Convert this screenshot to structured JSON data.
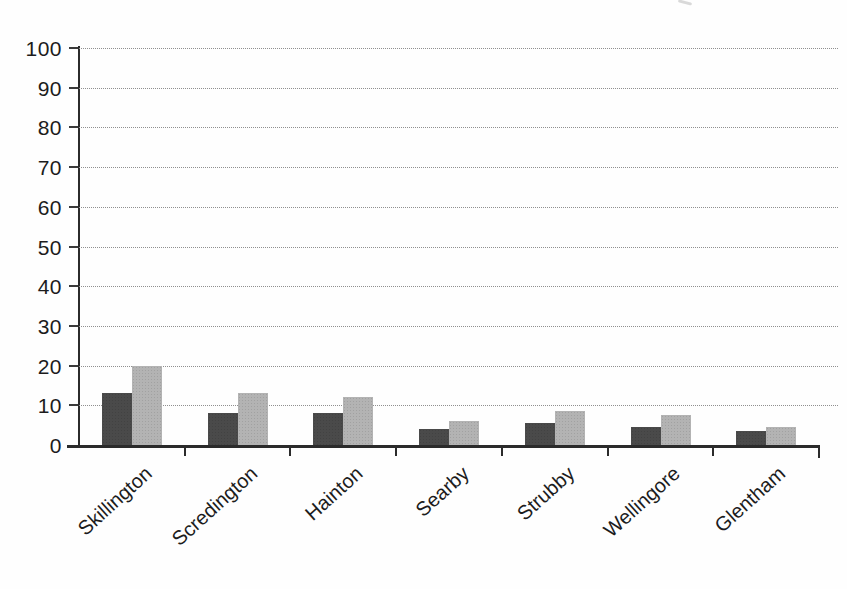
{
  "chart_data": {
    "type": "bar",
    "title": "",
    "xlabel": "",
    "ylabel": "",
    "categories": [
      "Skillington",
      "Scredington",
      "Hainton",
      "Searby",
      "Strubby",
      "Wellingore",
      "Glentham"
    ],
    "series": [
      {
        "name": "dark-gray-series",
        "color": "#4a4a4a",
        "values": [
          13,
          8,
          8,
          4,
          5.5,
          4.5,
          3.5
        ]
      },
      {
        "name": "light-gray-series",
        "color": "#b3b3b3",
        "values": [
          20,
          13,
          12,
          6,
          8.5,
          7.5,
          4.5
        ]
      }
    ],
    "ylim": [
      0,
      100
    ],
    "yticks": [
      0,
      10,
      20,
      30,
      40,
      50,
      60,
      70,
      80,
      90,
      100
    ],
    "grid": true,
    "legend": false,
    "axis_color": "#2b2b2b",
    "gridline_color": "#8f8f8f",
    "text_color": "#1c1c1c",
    "background_color": "#fefefe"
  }
}
